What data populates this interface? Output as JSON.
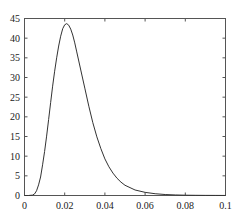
{
  "chart_data": {
    "type": "line",
    "title": "",
    "xlabel": "",
    "ylabel": "",
    "xlim": [
      0,
      0.1
    ],
    "ylim": [
      0,
      45
    ],
    "grid": false,
    "legend": null,
    "x_ticks": [
      0,
      0.02,
      0.04,
      0.06,
      0.08,
      0.1
    ],
    "x_tick_labels": [
      "0",
      "0.02",
      "0.04",
      "0.06",
      "0.08",
      "0.1"
    ],
    "y_ticks": [
      0,
      5,
      10,
      15,
      20,
      25,
      30,
      35,
      40,
      45
    ],
    "y_tick_labels": [
      "0",
      "5",
      "10",
      "15",
      "20",
      "25",
      "30",
      "35",
      "40",
      "45"
    ],
    "series": [
      {
        "name": "density",
        "color": "#333333",
        "x": [
          0,
          0.002,
          0.004,
          0.005,
          0.006,
          0.007,
          0.008,
          0.009,
          0.01,
          0.011,
          0.012,
          0.013,
          0.014,
          0.015,
          0.016,
          0.017,
          0.018,
          0.019,
          0.02,
          0.021,
          0.022,
          0.023,
          0.024,
          0.025,
          0.026,
          0.028,
          0.03,
          0.032,
          0.034,
          0.036,
          0.038,
          0.04,
          0.042,
          0.044,
          0.046,
          0.048,
          0.05,
          0.055,
          0.06,
          0.065,
          0.07,
          0.075,
          0.08,
          0.085,
          0.09,
          0.095,
          0.1
        ],
        "y": [
          0,
          0,
          0.1,
          0.4,
          1.2,
          2.7,
          4.7,
          7.8,
          11.2,
          15.1,
          19.3,
          23.6,
          27.8,
          31.6,
          35.0,
          38.0,
          40.5,
          42.4,
          43.4,
          43.7,
          43.3,
          42.3,
          40.8,
          38.8,
          36.5,
          31.9,
          27.3,
          22.7,
          18.5,
          14.9,
          11.9,
          9.3,
          7.3,
          5.7,
          4.4,
          3.4,
          2.6,
          1.4,
          0.8,
          0.45,
          0.25,
          0.14,
          0.08,
          0.05,
          0.03,
          0.02,
          0.01
        ]
      }
    ]
  }
}
